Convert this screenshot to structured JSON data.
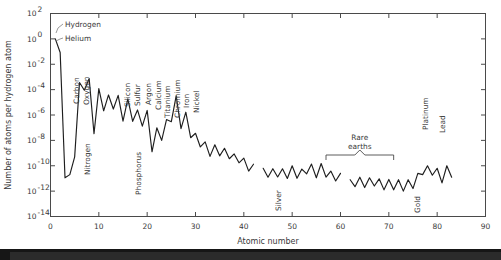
{
  "figure": {
    "title": "",
    "xaxis_label": "Atomic number",
    "yaxis_label": "Number of atoms per hydrogen atom",
    "xticks": [
      "0",
      "10",
      "20",
      "30",
      "40",
      "50",
      "60",
      "70",
      "80",
      "90"
    ],
    "ytick_exponents": [
      "2",
      "0",
      "-2",
      "-4",
      "-6",
      "-8",
      "-10",
      "-12",
      "-14"
    ],
    "ytick_mantissa": "10"
  },
  "annotations": {
    "rare_earths_line1": "Rare",
    "rare_earths_line2": "earths",
    "elements": [
      {
        "name": "Hydrogen",
        "z": 1,
        "orient": "horizontal"
      },
      {
        "name": "Helium",
        "z": 2,
        "orient": "horizontal"
      },
      {
        "name": "Carbon",
        "z": 6,
        "orient": "vertical"
      },
      {
        "name": "Nitrogen",
        "z": 7,
        "orient": "vertical"
      },
      {
        "name": "Oxygen",
        "z": 8,
        "orient": "vertical"
      },
      {
        "name": "Silicon",
        "z": 14,
        "orient": "vertical"
      },
      {
        "name": "Phosphorus",
        "z": 15,
        "orient": "vertical"
      },
      {
        "name": "Sulfur",
        "z": 16,
        "orient": "vertical"
      },
      {
        "name": "Argon",
        "z": 18,
        "orient": "vertical"
      },
      {
        "name": "Calcium",
        "z": 20,
        "orient": "vertical"
      },
      {
        "name": "Titanium",
        "z": 22,
        "orient": "vertical"
      },
      {
        "name": "Chromium",
        "z": 24,
        "orient": "vertical"
      },
      {
        "name": "Iron",
        "z": 26,
        "orient": "vertical"
      },
      {
        "name": "Nickel",
        "z": 28,
        "orient": "vertical"
      },
      {
        "name": "Silver",
        "z": 47,
        "orient": "vertical"
      },
      {
        "name": "Gold",
        "z": 79,
        "orient": "vertical"
      },
      {
        "name": "Platinum",
        "z": 78,
        "orient": "vertical"
      },
      {
        "name": "Lead",
        "z": 82,
        "orient": "vertical"
      }
    ]
  },
  "chart_data": {
    "type": "line",
    "title": "",
    "xlabel": "Atomic number",
    "ylabel": "Number of atoms per hydrogen atom",
    "xlim": [
      0,
      90
    ],
    "ylim_log10": [
      -14,
      2
    ],
    "yscale": "log",
    "grid": false,
    "legend": "none",
    "series": [
      {
        "name": "Solar system elemental abundance",
        "x": [
          1,
          2,
          3,
          4,
          5,
          6,
          7,
          8,
          9,
          10,
          11,
          12,
          13,
          14,
          15,
          16,
          17,
          18,
          19,
          20,
          21,
          22,
          23,
          24,
          25,
          26,
          27,
          28,
          29,
          30,
          31,
          32,
          33,
          34,
          35,
          36,
          37,
          38,
          39,
          40,
          41,
          42,
          44,
          45,
          46,
          47,
          48,
          49,
          50,
          51,
          52,
          53,
          54,
          55,
          56,
          57,
          58,
          59,
          60,
          62,
          63,
          64,
          65,
          66,
          67,
          68,
          69,
          70,
          71,
          72,
          73,
          74,
          75,
          76,
          77,
          78,
          79,
          80,
          81,
          82,
          83
        ],
        "y_log10": [
          0.0,
          -1.07,
          -10.95,
          -10.7,
          -9.3,
          -3.44,
          -4.05,
          -3.13,
          -7.48,
          -3.92,
          -5.67,
          -4.42,
          -5.53,
          -4.45,
          -6.48,
          -4.73,
          -6.5,
          -5.6,
          -6.88,
          -5.64,
          -8.9,
          -7.01,
          -8.0,
          -6.36,
          -6.53,
          -4.49,
          -7.08,
          -5.78,
          -7.79,
          -7.44,
          -8.52,
          -8.12,
          -9.26,
          -8.35,
          -9.22,
          -8.62,
          -9.45,
          -9.07,
          -9.77,
          -9.4,
          -10.42,
          -9.88,
          -10.2,
          -10.9,
          -10.23,
          -10.88,
          -10.24,
          -11.0,
          -10.0,
          -10.99,
          -10.26,
          -10.64,
          -9.87,
          -10.95,
          -9.82,
          -10.9,
          -10.42,
          -11.2,
          -10.6,
          -11.1,
          -11.65,
          -10.9,
          -11.72,
          -10.95,
          -11.6,
          -11.03,
          -11.9,
          -11.08,
          -11.9,
          -11.1,
          -12.0,
          -11.1,
          -11.8,
          -10.6,
          -10.7,
          -10.0,
          -10.75,
          -10.2,
          -11.35,
          -10.0,
          -10.9
        ],
        "gaps_at_z": [
          43,
          61
        ],
        "color": "#1e1e1e"
      }
    ],
    "notes": [
      "Logarithmic y-axis spanning 1e-14 to 1e2, ticks every two decades",
      "Linear x-axis 0 to 90, ticks every 10",
      "Gaps at Z=43 (technetium) and Z=61 (promethium)",
      "Bracket annotation marks rare earths Z=57 to Z=71"
    ]
  }
}
